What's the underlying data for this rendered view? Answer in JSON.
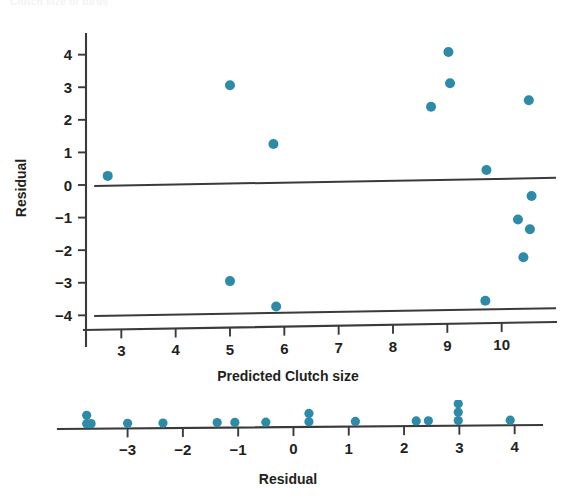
{
  "page": {
    "clipped_header_text": "Clutch size of birds",
    "background": "#ffffff",
    "accent": "#2d8ba8",
    "axis_color": "#3a3a3a"
  },
  "chart_data": [
    {
      "id": "residual-vs-predicted",
      "type": "scatter",
      "title": "",
      "xlabel": "Predicted Clutch size",
      "ylabel": "Residual",
      "xlim": [
        2.35,
        11.0
      ],
      "ylim": [
        -4.45,
        4.45
      ],
      "xticks": [
        3,
        4,
        5,
        6,
        7,
        8,
        9,
        10
      ],
      "xticklabels": [
        "3",
        "4",
        "5",
        "6",
        "7",
        "8",
        "9",
        "10"
      ],
      "yticks": [
        4,
        3,
        2,
        1,
        0,
        -1,
        -2,
        -3,
        -4
      ],
      "yticklabels": [
        "4",
        "3",
        "2",
        "1",
        "0",
        "−1",
        "−2",
        "−3",
        "−4"
      ],
      "grid": false,
      "legend": null,
      "marker_color": "#2d8ba8",
      "marker_size": 5.0,
      "reference_lines": [
        {
          "name": "zero-residual-line",
          "x0": 2.5,
          "y0": -0.03,
          "x1": 11.0,
          "y1": 0.22
        },
        {
          "name": "lower-boundary-line",
          "x0": 2.5,
          "y0": -4.02,
          "x1": 11.0,
          "y1": -3.78
        }
      ],
      "points": [
        {
          "x": 2.75,
          "y": 0.28
        },
        {
          "x": 5.0,
          "y": 3.06
        },
        {
          "x": 5.8,
          "y": 1.26
        },
        {
          "x": 8.7,
          "y": 2.4
        },
        {
          "x": 9.02,
          "y": 4.08
        },
        {
          "x": 9.05,
          "y": 3.12
        },
        {
          "x": 10.5,
          "y": 2.6
        },
        {
          "x": 9.72,
          "y": 0.46
        },
        {
          "x": 10.55,
          "y": -0.34
        },
        {
          "x": 10.3,
          "y": -1.06
        },
        {
          "x": 10.52,
          "y": -1.36
        },
        {
          "x": 10.4,
          "y": -2.22
        },
        {
          "x": 9.7,
          "y": -3.55
        },
        {
          "x": 5.0,
          "y": -2.95
        },
        {
          "x": 5.85,
          "y": -3.73
        }
      ]
    },
    {
      "id": "residual-dotplot",
      "type": "scatter",
      "title": "",
      "xlabel": "Residual",
      "ylabel": "",
      "xlim": [
        -4.15,
        4.35
      ],
      "ylim": [
        0,
        3
      ],
      "xticks": [
        -3,
        -2,
        -1,
        0,
        1,
        2,
        3,
        4
      ],
      "xticklabels": [
        "−3",
        "−2",
        "−1",
        "0",
        "1",
        "2",
        "3",
        "4"
      ],
      "grid": false,
      "legend": null,
      "marker_color": "#2d8ba8",
      "marker_size": 4.6,
      "stacks": [
        {
          "x": -3.74,
          "count": 2
        },
        {
          "x": -3.66,
          "count": 1
        },
        {
          "x": -3.0,
          "count": 1
        },
        {
          "x": -2.36,
          "count": 1
        },
        {
          "x": -1.38,
          "count": 1
        },
        {
          "x": -1.06,
          "count": 1
        },
        {
          "x": -0.5,
          "count": 1
        },
        {
          "x": 0.28,
          "count": 2
        },
        {
          "x": 1.12,
          "count": 1
        },
        {
          "x": 2.22,
          "count": 1
        },
        {
          "x": 2.44,
          "count": 1
        },
        {
          "x": 2.98,
          "count": 3
        },
        {
          "x": 3.92,
          "count": 1
        }
      ]
    }
  ]
}
